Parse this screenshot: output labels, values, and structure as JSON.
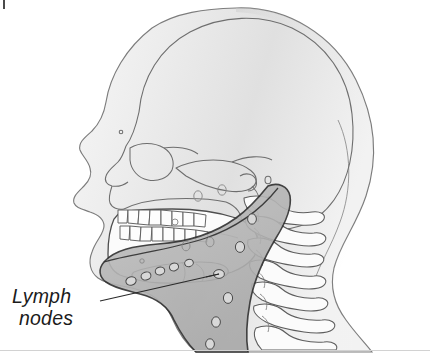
{
  "figure": {
    "kind": "anatomical-illustration",
    "view": "lateral head and neck",
    "style": "grayscale line drawing",
    "canvas": {
      "width": 430,
      "height": 363,
      "background": "#ffffff"
    }
  },
  "labels": {
    "lymph_line1": "Lymph",
    "lymph_line2": "nodes"
  },
  "colors": {
    "label_text": "#1b1b1b",
    "leader_line": "#2a2a2a",
    "soft_tissue_fill": "#e4e4e4",
    "soft_tissue_stroke": "#7c7c7c",
    "bone_stroke": "#6e6e6e",
    "bone_fill": "#fbfbfb",
    "node_chain_fill": "#b6b6b6",
    "node_chain_stroke": "#2f2f2f",
    "node_fill": "#d6d6d6",
    "node_stroke": "#5a5a5a",
    "base_rule": "#d2d2d2",
    "corner_tick": "#4a4a4a"
  },
  "structures": {
    "soft_tissue_outline": "head, face and neck profile silhouette",
    "cranium": "calvaria / skull vault",
    "orbit": "eye socket",
    "nasal_bone": "nasal aperture",
    "zygomatic_arch": "cheek bone arch",
    "maxilla": "upper jaw",
    "mandible": "lower jaw",
    "teeth_upper_count": 8,
    "teeth_lower_count": 8,
    "hyoid": "hyoid bone",
    "mastoid": "mastoid process",
    "cervical_vertebrae": [
      "C1",
      "C2",
      "C3",
      "C4",
      "C5",
      "C6",
      "C7"
    ],
    "sternocleidomastoid": "shaded deep cervical lymph chain region",
    "lymph_node_count": 18
  },
  "leader": {
    "from": [
      100,
      301
    ],
    "to": [
      219,
      274
    ]
  }
}
